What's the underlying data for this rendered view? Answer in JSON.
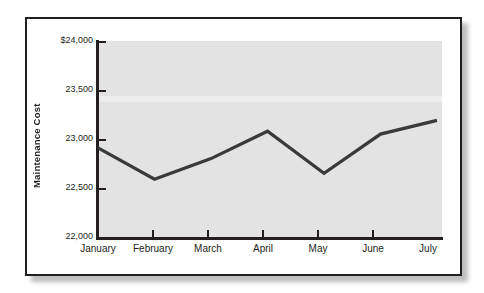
{
  "figure": {
    "background_color": "#ffffff",
    "frame_color": "#231f20",
    "panel_color": "#e3e3e3",
    "line_color": "#3a3a3a"
  },
  "chart_data": {
    "type": "line",
    "title": "",
    "subtitle": "",
    "xlabel": "",
    "ylabel": "Maintenance Cost",
    "categories": [
      "January",
      "February",
      "March",
      "April",
      "May",
      "June",
      "July"
    ],
    "values": [
      22920,
      22600,
      22810,
      23090,
      22660,
      23060,
      23200
    ],
    "series": [
      {
        "name": "Maintenance Cost",
        "values": [
          22920,
          22600,
          22810,
          23090,
          22660,
          23060,
          23200
        ]
      }
    ],
    "ylim": [
      22000,
      24000
    ],
    "ytick_values": [
      22000,
      22500,
      23000,
      23500,
      24000
    ],
    "ytick_labels": [
      "22,000",
      "22,500",
      "23,000",
      "23,500",
      "$24,000"
    ],
    "grid": false,
    "legend": null,
    "legend_position": "none",
    "annotations": []
  },
  "axis": {
    "y_labels": [
      {
        "text": "$24,000",
        "value": 24000
      },
      {
        "text": "23,500",
        "value": 23500
      },
      {
        "text": "23,000",
        "value": 23000
      },
      {
        "text": "22,500",
        "value": 22500
      },
      {
        "text": "22,000",
        "value": 22000
      }
    ],
    "x_labels": [
      {
        "text": "January"
      },
      {
        "text": "February"
      },
      {
        "text": "March"
      },
      {
        "text": "April"
      },
      {
        "text": "May"
      },
      {
        "text": "June"
      },
      {
        "text": "July"
      }
    ],
    "y_title": "Maintenance Cost"
  }
}
